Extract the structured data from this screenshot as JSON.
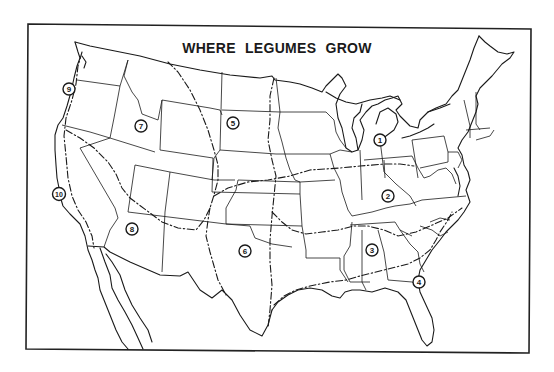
{
  "title": "WHERE LEGUMES GROW",
  "colors": {
    "ink": "#1a1a1a",
    "background": "#ffffff"
  },
  "regions": [
    {
      "id": 1,
      "label": "1",
      "x": 380,
      "y": 140
    },
    {
      "id": 2,
      "label": "2",
      "x": 388,
      "y": 196
    },
    {
      "id": 3,
      "label": "3",
      "x": 372,
      "y": 250
    },
    {
      "id": 4,
      "label": "4",
      "x": 419,
      "y": 282
    },
    {
      "id": 5,
      "label": "5",
      "x": 233,
      "y": 123
    },
    {
      "id": 6,
      "label": "6",
      "x": 245,
      "y": 251
    },
    {
      "id": 7,
      "label": "7",
      "x": 141,
      "y": 126
    },
    {
      "id": 8,
      "label": "8",
      "x": 132,
      "y": 229
    },
    {
      "id": 9,
      "label": "9",
      "x": 69,
      "y": 89
    },
    {
      "id": 10,
      "label": "10",
      "x": 59,
      "y": 194
    }
  ]
}
